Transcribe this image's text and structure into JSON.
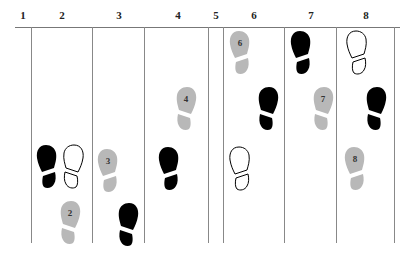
{
  "diagram": {
    "title": "",
    "counts": [
      "1",
      "2",
      "3",
      "4",
      "5",
      "6",
      "7",
      "8"
    ],
    "colors": {
      "filled": "#000000",
      "outline": "#000000",
      "guide": "#b8b8b8",
      "line": "#888888"
    },
    "legend_types": {
      "filled": "current foot step",
      "outline": "starting / reference position",
      "guide": "numbered step"
    },
    "footprints": [
      {
        "style": "filled",
        "side": "left",
        "count": "2",
        "label": ""
      },
      {
        "style": "outline",
        "side": "right",
        "count": "2",
        "label": ""
      },
      {
        "style": "guide",
        "side": "right",
        "count": "2",
        "label": "2"
      },
      {
        "style": "guide",
        "side": "left",
        "count": "3",
        "label": "3"
      },
      {
        "style": "filled",
        "side": "right",
        "count": "3",
        "label": ""
      },
      {
        "style": "guide",
        "side": "right",
        "count": "4",
        "label": "4"
      },
      {
        "style": "filled",
        "side": "left",
        "count": "4",
        "label": ""
      },
      {
        "style": "guide",
        "side": "left",
        "count": "6",
        "label": "6"
      },
      {
        "style": "filled",
        "side": "right",
        "count": "6",
        "label": ""
      },
      {
        "style": "outline",
        "side": "left",
        "count": "6",
        "label": ""
      },
      {
        "style": "filled",
        "side": "left",
        "count": "7",
        "label": ""
      },
      {
        "style": "guide",
        "side": "right",
        "count": "7",
        "label": "7"
      },
      {
        "style": "outline",
        "side": "left",
        "count": "8",
        "label": ""
      },
      {
        "style": "filled",
        "side": "right",
        "count": "8",
        "label": ""
      },
      {
        "style": "guide",
        "side": "left",
        "count": "8",
        "label": "8"
      }
    ]
  }
}
